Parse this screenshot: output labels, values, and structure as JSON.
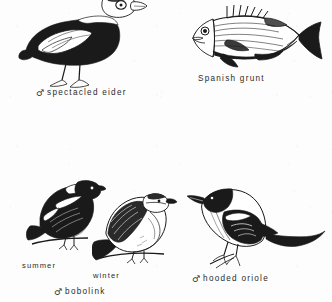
{
  "page": {
    "kind": "field-guide-illustration-plate",
    "background_color": "#fdfdfd",
    "ink_color": "#1a1a1a",
    "caption_color": "#2b2b2b"
  },
  "figures": [
    {
      "id": "spectacled-eider",
      "subject": "spectacled eider",
      "label": "spectacled eider",
      "sex_symbol": "♂",
      "position": "top-left"
    },
    {
      "id": "spanish-grunt",
      "subject": "Spanish grunt",
      "label": "Spanish grunt",
      "sex_symbol": "",
      "position": "top-right"
    },
    {
      "id": "bobolink",
      "subject": "bobolink",
      "label": "bobolink",
      "sex_symbol": "♂",
      "position": "bottom-left",
      "plumage_labels": [
        "summer",
        "winter"
      ]
    },
    {
      "id": "hooded-oriole",
      "subject": "hooded oriole",
      "label": "hooded oriole",
      "sex_symbol": "♂",
      "position": "bottom-right"
    }
  ],
  "captions": {
    "eider": "spectacled eider",
    "grunt": "Spanish grunt",
    "bobolink": "bobolink",
    "oriole": "hooded oriole",
    "summer": "summer",
    "winter": "winter",
    "male_symbol": "♂"
  }
}
